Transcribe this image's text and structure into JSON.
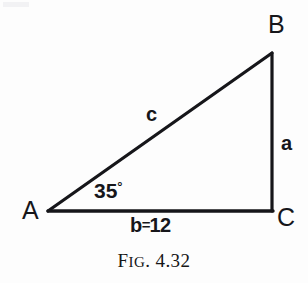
{
  "figure": {
    "caption": "FIG. 4.32",
    "caption_lead": "F",
    "caption_smallcaps": "IG",
    "caption_rest": ". 4.32",
    "background_color": "#fdfdfd",
    "ink_color": "#16161a"
  },
  "diagram": {
    "type": "right-triangle",
    "vertices": [
      {
        "name": "A",
        "label": "A",
        "x": 48,
        "y": 211
      },
      {
        "name": "B",
        "label": "B",
        "x": 272,
        "y": 53
      },
      {
        "name": "C",
        "label": "C",
        "x": 272,
        "y": 211
      }
    ],
    "sides": [
      {
        "name": "a",
        "label": "a",
        "from": "B",
        "to": "C",
        "orientation": "vertical"
      },
      {
        "name": "b",
        "label": "b=12",
        "value": 12,
        "from": "A",
        "to": "C",
        "orientation": "horizontal"
      },
      {
        "name": "c",
        "label": "c",
        "from": "A",
        "to": "B",
        "orientation": "hypotenuse"
      }
    ],
    "angles": [
      {
        "at": "A",
        "label": "35°",
        "value": 35,
        "unit": "degrees"
      }
    ],
    "angle_value_text": "35",
    "angle_degree_symbol": "°",
    "side_b_letter": "b",
    "side_b_equals": "=",
    "side_b_value": "12",
    "stroke_width": 3
  }
}
